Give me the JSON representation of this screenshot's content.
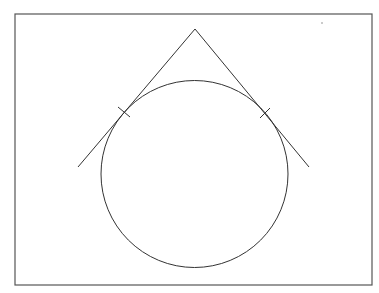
{
  "diagram": {
    "type": "geometry",
    "colors": {
      "background": "#ffffff",
      "stroke": "#333333",
      "frame": "#555555",
      "dot": "#888888"
    },
    "frame": {
      "x": 15,
      "y": 14,
      "width": 357,
      "height": 271
    },
    "circle": {
      "cx": 194.5,
      "cy": 174,
      "r": 93.5
    },
    "external_point": {
      "x": 195,
      "y": 29
    },
    "tangent_lines": [
      {
        "from": {
          "x": 195,
          "y": 29
        },
        "to": {
          "x": 78,
          "y": 167
        },
        "tangent_point": {
          "x": 124,
          "y": 112
        }
      },
      {
        "from": {
          "x": 195,
          "y": 29
        },
        "to": {
          "x": 309,
          "y": 167
        },
        "tangent_point": {
          "x": 265,
          "y": 113
        }
      }
    ],
    "tick_marks": [
      {
        "x1": 118,
        "y1": 107,
        "x2": 130,
        "y2": 117
      },
      {
        "x1": 260,
        "y1": 118,
        "x2": 270,
        "y2": 108
      }
    ],
    "stray_dot": {
      "x": 322,
      "y": 23,
      "r": 0.8
    }
  }
}
